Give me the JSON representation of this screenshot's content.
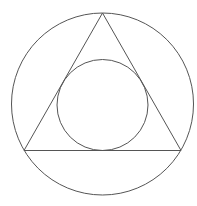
{
  "diagram": {
    "type": "geometric-construction",
    "stroke_color": "#555555",
    "background": "#ffffff",
    "outer_circle": {
      "cx": 102.5,
      "cy": 104,
      "r": 91
    },
    "triangle": {
      "vertices": [
        {
          "x": 102.5,
          "y": 13
        },
        {
          "x": 24,
          "y": 150.5
        },
        {
          "x": 181,
          "y": 150.5
        }
      ]
    },
    "inner_circle": {
      "cx": 102.5,
      "cy": 105,
      "r": 45.5
    }
  }
}
